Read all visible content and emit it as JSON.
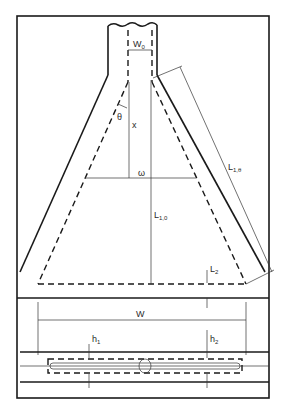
{
  "figure": {
    "labels": {
      "w0": {
        "main": "W",
        "sub": "0"
      },
      "theta": {
        "main": "θ"
      },
      "x": {
        "main": "x"
      },
      "omega": {
        "main": "ω"
      },
      "l1theta": {
        "main": "L",
        "sub": "1,θ"
      },
      "l10": {
        "main": "L",
        "sub": "1,0"
      },
      "l2": {
        "main": "L",
        "sub": "2"
      },
      "W": {
        "main": "W"
      },
      "h1": {
        "main": "h",
        "sub": "1"
      },
      "h2": {
        "main": "h",
        "sub": "2"
      }
    },
    "colors": {
      "ink": "#1a1a1a",
      "background": "#ffffff"
    }
  }
}
